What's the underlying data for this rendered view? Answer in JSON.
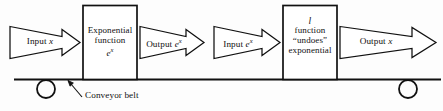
{
  "figure": {
    "type": "flow-diagram",
    "background_color": "#fdfdfd",
    "stroke_color": "#111111"
  },
  "machines": [
    {
      "id": "exponential-machine",
      "line1": "Exponential",
      "line2": "function",
      "line3_base": "e",
      "line3_exp": "x"
    },
    {
      "id": "inverse-machine",
      "line1": "l",
      "line2": "function",
      "line3": "“undoes”",
      "line4": "exponential"
    }
  ],
  "arrows": [
    {
      "id": "input-x-arrow",
      "prefix": "Input ",
      "var": "x",
      "exp": ""
    },
    {
      "id": "output-ex-arrow",
      "prefix": "Output ",
      "var": "e",
      "exp": "x"
    },
    {
      "id": "input-ex-arrow",
      "prefix": "Input ",
      "var": "e",
      "exp": "x"
    },
    {
      "id": "output-x-arrow",
      "prefix": "Output ",
      "var": "x",
      "exp": ""
    }
  ],
  "annotation": {
    "conveyor_belt_label": "Conveyor belt"
  },
  "wheels": [
    {
      "id": "left-wheel",
      "cx": 46,
      "cy": 89,
      "r": 9
    },
    {
      "id": "right-wheel",
      "cx": 408,
      "cy": 89,
      "r": 9
    }
  ]
}
